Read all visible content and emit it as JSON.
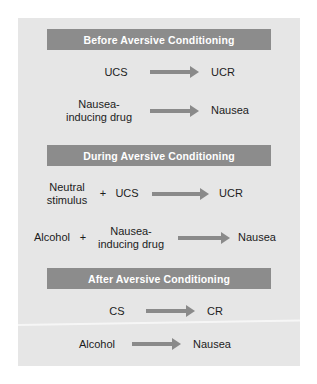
{
  "figure": {
    "title": "Aversive Conditioning",
    "colors": {
      "panel_background": "#e6e6e6",
      "header_bar": "#8c8c8c",
      "header_text": "#ffffff",
      "body_text": "#1c1c1c",
      "arrow": "#8a8a8a",
      "page_background": "#ffffff"
    },
    "sections": [
      {
        "header": "Before Aversive Conditioning",
        "rows": [
          {
            "left": "UCS",
            "plus": "",
            "middle": "",
            "arrow": "arrow-right-icon",
            "right": "UCR"
          },
          {
            "left": "Nausea-\ninducing drug",
            "plus": "",
            "middle": "",
            "arrow": "arrow-right-icon",
            "right": "Nausea"
          }
        ]
      },
      {
        "header": "During Aversive Conditioning",
        "rows": [
          {
            "left": "Neutral\nstimulus",
            "plus": "+",
            "middle": "UCS",
            "arrow": "arrow-right-icon",
            "right": "UCR"
          },
          {
            "left": "Alcohol",
            "plus": "+",
            "middle": "Nausea-\ninducing drug",
            "arrow": "arrow-right-icon",
            "right": "Nausea"
          }
        ]
      },
      {
        "header": "After Aversive Conditioning",
        "rows": [
          {
            "left": "CS",
            "plus": "",
            "middle": "",
            "arrow": "arrow-right-icon",
            "right": "CR"
          },
          {
            "left": "Alcohol",
            "plus": "",
            "middle": "",
            "arrow": "arrow-right-icon",
            "right": "Nausea"
          }
        ]
      }
    ]
  }
}
